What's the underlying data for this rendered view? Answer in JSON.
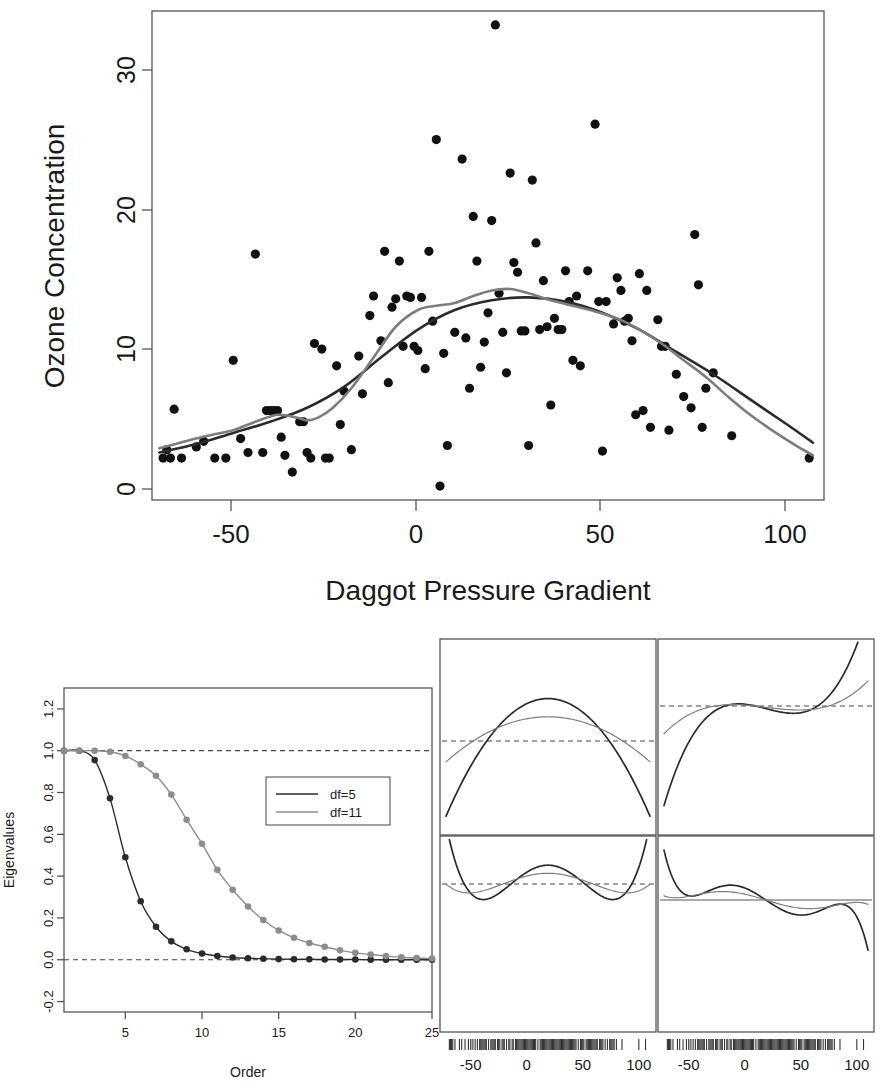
{
  "figure": {
    "title": "",
    "panel_count": 3
  },
  "chart_data": [
    {
      "id": "ozone-scatter",
      "type": "scatter",
      "title": "",
      "xlabel": "Daggot Pressure Gradient",
      "ylabel": "Ozone Concentration",
      "xlim": [
        -72,
        110
      ],
      "ylim": [
        0,
        35
      ],
      "xticks": [
        -50,
        0,
        50,
        100
      ],
      "xtick_labels": [
        "-50",
        "0",
        "50",
        "100"
      ],
      "yticks": [
        0,
        10,
        20,
        30
      ],
      "ytick_labels": [
        "0",
        "10",
        "20",
        "30"
      ],
      "grid": false,
      "legend_position": "none",
      "points": [
        [
          -69,
          3.0
        ],
        [
          -68,
          3.6
        ],
        [
          -67,
          3.0
        ],
        [
          -66,
          6.5
        ],
        [
          -64,
          3.0
        ],
        [
          -60,
          3.8
        ],
        [
          -58,
          4.2
        ],
        [
          -55,
          3.0
        ],
        [
          -52,
          3.0
        ],
        [
          -50,
          10.0
        ],
        [
          -48,
          4.4
        ],
        [
          -46,
          3.4
        ],
        [
          -44,
          17.6
        ],
        [
          -42,
          3.4
        ],
        [
          -41,
          6.4
        ],
        [
          -40,
          6.4
        ],
        [
          -39,
          6.4
        ],
        [
          -38,
          6.4
        ],
        [
          -37,
          4.5
        ],
        [
          -36,
          3.2
        ],
        [
          -34,
          2.0
        ],
        [
          -32,
          5.6
        ],
        [
          -31,
          5.6
        ],
        [
          -30,
          3.4
        ],
        [
          -29,
          3.0
        ],
        [
          -28,
          11.2
        ],
        [
          -26,
          10.8
        ],
        [
          -25,
          3.0
        ],
        [
          -24,
          3.0
        ],
        [
          -22,
          9.6
        ],
        [
          -21,
          5.4
        ],
        [
          -20,
          7.8
        ],
        [
          -18,
          3.6
        ],
        [
          -16,
          10.3
        ],
        [
          -15,
          7.6
        ],
        [
          -13,
          13.2
        ],
        [
          -12,
          14.6
        ],
        [
          -10,
          11.4
        ],
        [
          -9,
          17.8
        ],
        [
          -8,
          8.4
        ],
        [
          -7,
          13.8
        ],
        [
          -6,
          14.4
        ],
        [
          -5,
          17.1
        ],
        [
          -4,
          11.0
        ],
        [
          -3,
          14.6
        ],
        [
          -2,
          14.5
        ],
        [
          -1,
          11.0
        ],
        [
          0,
          10.7
        ],
        [
          1,
          14.5
        ],
        [
          2,
          9.4
        ],
        [
          3,
          17.8
        ],
        [
          4,
          12.8
        ],
        [
          5,
          25.8
        ],
        [
          6,
          1.0
        ],
        [
          7,
          10.5
        ],
        [
          8,
          3.9
        ],
        [
          10,
          12.0
        ],
        [
          12,
          24.4
        ],
        [
          13,
          11.6
        ],
        [
          14,
          8.0
        ],
        [
          15,
          20.3
        ],
        [
          16,
          17.1
        ],
        [
          17,
          9.5
        ],
        [
          18,
          11.3
        ],
        [
          19,
          13.4
        ],
        [
          20,
          20.0
        ],
        [
          21,
          34.0
        ],
        [
          22,
          14.8
        ],
        [
          23,
          12.0
        ],
        [
          24,
          9.1
        ],
        [
          25,
          23.4
        ],
        [
          26,
          17.0
        ],
        [
          27,
          16.3
        ],
        [
          28,
          12.1
        ],
        [
          29,
          12.1
        ],
        [
          30,
          3.9
        ],
        [
          31,
          22.9
        ],
        [
          32,
          18.4
        ],
        [
          33,
          12.2
        ],
        [
          34,
          15.7
        ],
        [
          35,
          12.4
        ],
        [
          36,
          6.8
        ],
        [
          37,
          13.0
        ],
        [
          38,
          12.2
        ],
        [
          39,
          12.2
        ],
        [
          40,
          16.4
        ],
        [
          41,
          14.2
        ],
        [
          42,
          10.0
        ],
        [
          43,
          14.6
        ],
        [
          44,
          9.6
        ],
        [
          46,
          16.4
        ],
        [
          48,
          26.9
        ],
        [
          49,
          14.2
        ],
        [
          50,
          3.5
        ],
        [
          51,
          14.2
        ],
        [
          53,
          12.6
        ],
        [
          54,
          15.9
        ],
        [
          55,
          15.0
        ],
        [
          56,
          12.8
        ],
        [
          57,
          13.0
        ],
        [
          58,
          11.4
        ],
        [
          59,
          6.1
        ],
        [
          60,
          16.2
        ],
        [
          61,
          6.4
        ],
        [
          62,
          15.0
        ],
        [
          63,
          5.2
        ],
        [
          65,
          12.9
        ],
        [
          66,
          11.0
        ],
        [
          67,
          11.0
        ],
        [
          68,
          5.0
        ],
        [
          70,
          9.0
        ],
        [
          72,
          7.4
        ],
        [
          74,
          6.6
        ],
        [
          75,
          19.0
        ],
        [
          76,
          15.4
        ],
        [
          77,
          5.2
        ],
        [
          78,
          8.0
        ],
        [
          80,
          9.1
        ],
        [
          85,
          4.6
        ],
        [
          106,
          3.0
        ]
      ],
      "series": [
        {
          "name": "df=5",
          "color": "#2b2b2b",
          "style": "smooth-curve"
        },
        {
          "name": "df=11",
          "color": "#7d7d7d",
          "style": "smooth-curve"
        }
      ]
    },
    {
      "id": "eigenvalues",
      "type": "line",
      "title": "",
      "xlabel": "Order",
      "ylabel": "Eigenvalues",
      "xlim": [
        1,
        25
      ],
      "ylim": [
        -0.25,
        1.3
      ],
      "xticks": [
        5,
        10,
        15,
        20,
        25
      ],
      "xtick_labels": [
        "5",
        "10",
        "15",
        "20",
        "25"
      ],
      "yticks": [
        -0.2,
        0.0,
        0.2,
        0.4,
        0.6,
        0.8,
        1.0,
        1.2
      ],
      "ytick_labels": [
        "-0.2",
        "0.0",
        "0.2",
        "0.4",
        "0.6",
        "0.8",
        "1.0",
        "1.2"
      ],
      "grid": false,
      "reference_lines": [
        1.0,
        0.0
      ],
      "legend_position": "right-upper",
      "x": [
        1,
        2,
        3,
        4,
        5,
        6,
        7,
        8,
        9,
        10,
        11,
        12,
        13,
        14,
        15,
        16,
        17,
        18,
        19,
        20,
        21,
        22,
        23,
        24,
        25
      ],
      "series": [
        {
          "name": "df=5",
          "color": "#2b2b2b",
          "values": [
            1.0,
            1.0,
            0.955,
            0.772,
            0.49,
            0.28,
            0.158,
            0.088,
            0.05,
            0.03,
            0.018,
            0.011,
            0.007,
            0.005,
            0.003,
            0.002,
            0.002,
            0.001,
            0.001,
            0.001,
            0.0,
            0.0,
            0.0,
            0.0,
            0.0
          ]
        },
        {
          "name": "df=11",
          "color": "#8c8c8c",
          "values": [
            1.0,
            1.0,
            1.0,
            0.995,
            0.975,
            0.935,
            0.88,
            0.79,
            0.67,
            0.555,
            0.43,
            0.335,
            0.255,
            0.19,
            0.14,
            0.105,
            0.08,
            0.062,
            0.045,
            0.033,
            0.025,
            0.018,
            0.012,
            0.008,
            0.006
          ]
        }
      ]
    },
    {
      "id": "basis-functions",
      "type": "line",
      "title": "",
      "xlabel": "",
      "ylabel": "",
      "subplot_grid": [
        2,
        2
      ],
      "xlim": [
        -72,
        110
      ],
      "xticks": [
        -50,
        0,
        50,
        100
      ],
      "xtick_labels": [
        "-50",
        "0",
        "50",
        "100"
      ],
      "grid": false,
      "rug": true,
      "legend_position": "none",
      "subplots": [
        {
          "position": "top-left",
          "reference_line": {
            "value": 0.0,
            "style": "dashed"
          },
          "series": [
            {
              "name": "df=5",
              "color": "#2b2b2b",
              "shape": "parabola-up"
            },
            {
              "name": "df=11",
              "color": "#7d7d7d",
              "shape": "parabola-up"
            }
          ]
        },
        {
          "position": "top-right",
          "reference_line": {
            "value": 0.0,
            "style": "dashed"
          },
          "series": [
            {
              "name": "df=5",
              "color": "#2b2b2b",
              "shape": "cubic"
            },
            {
              "name": "df=11",
              "color": "#7d7d7d",
              "shape": "cubic"
            }
          ]
        },
        {
          "position": "bottom-left",
          "reference_line": {
            "value": 0.0,
            "style": "dashed"
          },
          "series": [
            {
              "name": "df=5",
              "color": "#2b2b2b",
              "shape": "quartic"
            },
            {
              "name": "df=11",
              "color": "#7d7d7d",
              "shape": "quartic"
            }
          ]
        },
        {
          "position": "bottom-right",
          "reference_line": {
            "value": 0.0,
            "style": "solid"
          },
          "series": [
            {
              "name": "df=5",
              "color": "#2b2b2b",
              "shape": "quintic"
            },
            {
              "name": "df=11",
              "color": "#7d7d7d",
              "shape": "quintic"
            }
          ]
        }
      ]
    }
  ],
  "legend": {
    "entries": [
      {
        "label": "df=5",
        "color": "#2b2b2b"
      },
      {
        "label": "df=11",
        "color": "#8c8c8c"
      }
    ]
  },
  "colors": {
    "df5": "#2b2b2b",
    "df11": "#8c8c8c",
    "axis": "#555555",
    "point": "#111111",
    "background": "#ffffff"
  }
}
